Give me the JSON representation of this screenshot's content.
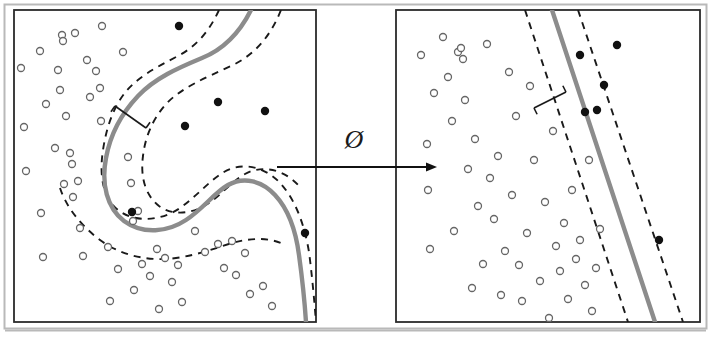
{
  "figure": {
    "background_color": "#ffffff",
    "outer_frame_color": "#b9b9b9",
    "panel_border_color": "#2b2b2b",
    "boundary_color": "#8c8c8c",
    "margin_line_color": "#1a1a1a",
    "positive_point_color": "#111111",
    "negative_point_color": "#ffffff",
    "negative_point_stroke": "#666666",
    "arrow_color": "#111111"
  },
  "transform": {
    "symbol": "Ø",
    "symbol_name": "phi-feature-map-symbol",
    "arrow_name": "transform-arrow",
    "arrow_x1": 277,
    "arrow_x2": 437,
    "arrow_y": 167
  },
  "panels": [
    {
      "id": "input-space-panel",
      "name": "left-panel-input-space",
      "x": 14,
      "y": 10,
      "width": 302,
      "height": 312,
      "boundary_type": "curve",
      "boundary_path": "M 251 10 C 238 36, 222 50, 202 58 C 178 68, 155 78, 138 96 C 121 114, 110 136, 106 158 C 101 184, 107 208, 124 221 C 143 235, 168 232, 186 220 C 203 209, 214 193, 228 185 C 244 176, 262 181, 275 195 C 289 210, 296 232, 299 255 C 303 284, 305 307, 306 322",
      "margin_upper_path": "M 219 10 C 208 34, 194 48, 176 57 C 155 68, 136 78, 124 94 C 112 110, 106 130, 103 150 C 99 176, 103 198, 118 210 C 136 224, 163 220, 180 208 C 197 196, 209 181, 224 172 C 243 161, 266 167, 281 184 C 297 202, 305 228, 309 252 C 313 283, 315 310, 316 322",
      "margin_lower_path": "M 281 10 C 269 40, 252 56, 231 66 C 205 78, 181 88, 166 104 C 152 120, 145 138, 143 156 C 140 178, 146 196, 159 206 C 174 217, 195 213, 209 203 C 222 194, 231 182, 245 174 C 263 164, 285 170, 299 186",
      "margin_lower_path2": "M 60 188 C 66 206, 79 224, 100 240 C 120 255, 148 262, 176 258 C 198 255, 216 248, 232 243 C 250 238, 268 237, 283 244",
      "margin_indicator": {
        "x1": 115,
        "y1": 106,
        "x2": 146,
        "y2": 128,
        "tick": 7
      },
      "circles": [
        [
          21,
          68
        ],
        [
          24,
          127
        ],
        [
          26,
          171
        ],
        [
          40,
          51
        ],
        [
          41,
          213
        ],
        [
          43,
          257
        ],
        [
          46,
          104
        ],
        [
          55,
          148
        ],
        [
          58,
          70
        ],
        [
          60,
          90
        ],
        [
          62,
          35
        ],
        [
          63,
          41
        ],
        [
          64,
          184
        ],
        [
          66,
          116
        ],
        [
          70,
          153
        ],
        [
          72,
          164
        ],
        [
          73,
          197
        ],
        [
          75,
          33
        ],
        [
          78,
          181
        ],
        [
          80,
          228
        ],
        [
          83,
          256
        ],
        [
          87,
          60
        ],
        [
          90,
          97
        ],
        [
          96,
          71
        ],
        [
          100,
          88
        ],
        [
          101,
          121
        ],
        [
          102,
          26
        ],
        [
          108,
          247
        ],
        [
          110,
          301
        ],
        [
          118,
          269
        ],
        [
          123,
          52
        ],
        [
          128,
          157
        ],
        [
          131,
          183
        ],
        [
          133,
          221
        ],
        [
          134,
          290
        ],
        [
          138,
          211
        ],
        [
          142,
          264
        ],
        [
          150,
          276
        ],
        [
          157,
          249
        ],
        [
          159,
          309
        ],
        [
          165,
          258
        ],
        [
          172,
          282
        ],
        [
          178,
          265
        ],
        [
          182,
          302
        ],
        [
          195,
          231
        ],
        [
          205,
          252
        ],
        [
          218,
          244
        ],
        [
          224,
          268
        ],
        [
          232,
          241
        ],
        [
          236,
          275
        ],
        [
          245,
          253
        ],
        [
          250,
          294
        ],
        [
          263,
          286
        ],
        [
          272,
          306
        ]
      ],
      "dots": [
        [
          179,
          26
        ],
        [
          218,
          102
        ],
        [
          265,
          111
        ],
        [
          185,
          126
        ],
        [
          132,
          212
        ],
        [
          305,
          233
        ]
      ]
    },
    {
      "id": "feature-space-panel",
      "name": "right-panel-feature-space",
      "x": 396,
      "y": 10,
      "width": 304,
      "height": 312,
      "boundary_type": "line",
      "boundary_line": {
        "x1": 552,
        "y1": 10,
        "x2": 655,
        "y2": 322
      },
      "margin_upper_line": {
        "x1": 525,
        "y1": 10,
        "x2": 628,
        "y2": 322
      },
      "margin_lower_line": {
        "x1": 578,
        "y1": 10,
        "x2": 683,
        "y2": 322
      },
      "margin_indicator": {
        "x1": 534,
        "y1": 108,
        "x2": 566,
        "y2": 92,
        "tick": 7
      },
      "circles": [
        [
          421,
          55
        ],
        [
          427,
          144
        ],
        [
          428,
          190
        ],
        [
          430,
          249
        ],
        [
          434,
          93
        ],
        [
          443,
          37
        ],
        [
          448,
          77
        ],
        [
          452,
          121
        ],
        [
          454,
          231
        ],
        [
          458,
          52
        ],
        [
          461,
          48
        ],
        [
          463,
          59
        ],
        [
          465,
          100
        ],
        [
          468,
          169
        ],
        [
          472,
          288
        ],
        [
          475,
          139
        ],
        [
          478,
          206
        ],
        [
          483,
          264
        ],
        [
          487,
          44
        ],
        [
          490,
          178
        ],
        [
          494,
          219
        ],
        [
          498,
          156
        ],
        [
          501,
          295
        ],
        [
          505,
          251
        ],
        [
          509,
          72
        ],
        [
          512,
          195
        ],
        [
          516,
          116
        ],
        [
          519,
          265
        ],
        [
          522,
          301
        ],
        [
          527,
          233
        ],
        [
          530,
          86
        ],
        [
          534,
          160
        ],
        [
          540,
          281
        ],
        [
          545,
          202
        ],
        [
          549,
          318
        ],
        [
          553,
          131
        ],
        [
          556,
          246
        ],
        [
          560,
          271
        ],
        [
          564,
          223
        ],
        [
          568,
          299
        ],
        [
          572,
          190
        ],
        [
          576,
          259
        ],
        [
          580,
          240
        ],
        [
          585,
          285
        ],
        [
          589,
          160
        ],
        [
          592,
          311
        ],
        [
          596,
          268
        ],
        [
          600,
          229
        ]
      ],
      "dots": [
        [
          580,
          55
        ],
        [
          617,
          45
        ],
        [
          604,
          85
        ],
        [
          597,
          110
        ],
        [
          585,
          112
        ],
        [
          659,
          240
        ]
      ]
    }
  ]
}
